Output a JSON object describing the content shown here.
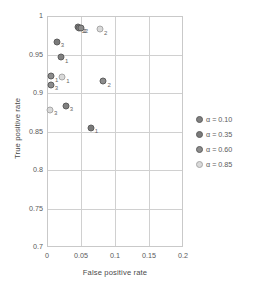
{
  "chart_data": {
    "type": "scatter",
    "title": "",
    "xlabel": "False positive rate",
    "ylabel": "True positive rate",
    "xlim": [
      0,
      0.2
    ],
    "ylim": [
      0.7,
      1
    ],
    "xticks": [
      "0",
      "0.05",
      "0.1",
      "0.15",
      "0.2"
    ],
    "xtick_values": [
      0,
      0.05,
      0.1,
      0.15,
      0.2
    ],
    "yticks": [
      "0.7",
      "0.75",
      "0.8",
      "0.85",
      "0.9",
      "0.95",
      "1"
    ],
    "ytick_values": [
      0.7,
      0.75,
      0.8,
      0.85,
      0.9,
      0.95,
      1
    ],
    "grid": true,
    "legend_position": "right",
    "series": [
      {
        "name": "α = 0.10",
        "alpha": 0.1,
        "color": "#808080",
        "points": [
          {
            "x": 0.0455,
            "y": 0.9855,
            "label": "2"
          },
          {
            "x": 0.0205,
            "y": 0.9465,
            "label": "1"
          },
          {
            "x": 0.0275,
            "y": 0.8835,
            "label": "3"
          }
        ]
      },
      {
        "name": "α = 0.35",
        "alpha": 0.35,
        "color": "#7a7a7a",
        "points": [
          {
            "x": 0.0475,
            "y": 0.9845,
            "label": "2"
          },
          {
            "x": 0.0145,
            "y": 0.9665,
            "label": "3"
          },
          {
            "x": 0.0645,
            "y": 0.855,
            "label": "1"
          }
        ]
      },
      {
        "name": "α = 0.60",
        "alpha": 0.6,
        "color": "#8c8c8c",
        "points": [
          {
            "x": 0.0495,
            "y": 0.985,
            "label": "2"
          },
          {
            "x": 0.006,
            "y": 0.9215,
            "label": "1"
          },
          {
            "x": 0.0055,
            "y": 0.9105,
            "label": "3"
          },
          {
            "x": 0.083,
            "y": 0.9155,
            "label": "2"
          }
        ]
      },
      {
        "name": "α = 0.85",
        "alpha": 0.85,
        "color": "#d9d9d9",
        "points": [
          {
            "x": 0.078,
            "y": 0.983,
            "label": "2"
          },
          {
            "x": 0.0225,
            "y": 0.9205,
            "label": "1"
          },
          {
            "x": 0.0045,
            "y": 0.8785,
            "label": "3"
          }
        ]
      }
    ]
  },
  "legend": {
    "items": [
      {
        "label": "α = 0.10",
        "color": "#808080"
      },
      {
        "label": "α = 0.35",
        "color": "#7a7a7a"
      },
      {
        "label": "α = 0.60",
        "color": "#8c8c8c"
      },
      {
        "label": "α = 0.85",
        "color": "#d9d9d9"
      }
    ]
  }
}
